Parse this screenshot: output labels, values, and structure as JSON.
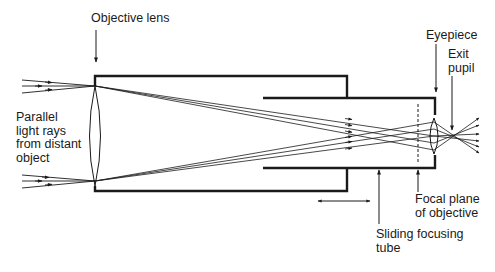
{
  "diagram": {
    "colors": {
      "ink": "#1a1a1a",
      "background": "#ffffff"
    },
    "labels": {
      "objective_lens": "Objective lens",
      "parallel_rays": "Parallel\nlight rays\nfrom distant\nobject",
      "eyepiece": "Eyepiece",
      "exit_pupil": "Exit\npupil",
      "focal_plane": "Focal plane\nof objective",
      "sliding_tube": "Sliding focusing\ntube"
    },
    "components": [
      "objective-lens",
      "main-tube",
      "sliding-focusing-tube",
      "focal-plane-dashed-line",
      "eyepiece-lens",
      "incoming-ray-bundle-top",
      "incoming-ray-bundle-bottom",
      "exit-pupil-crossing",
      "double-headed-slide-arrow"
    ]
  }
}
